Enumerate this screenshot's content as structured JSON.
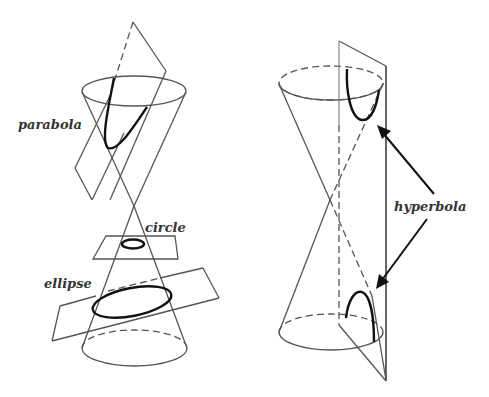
{
  "diagram": {
    "left_figure": {
      "labels": {
        "parabola": "parabola",
        "circle": "circle",
        "ellipse": "ellipse"
      }
    },
    "right_figure": {
      "labels": {
        "hyperbola": "hyperbola"
      }
    },
    "colors": {
      "background": "#ffffff",
      "line": "#555555",
      "curve": "#111111",
      "text": "#333333"
    }
  }
}
